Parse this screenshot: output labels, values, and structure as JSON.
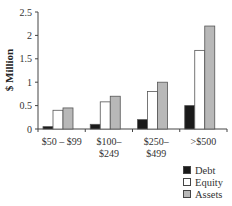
{
  "chart_data": {
    "type": "bar",
    "title": "",
    "xlabel": "",
    "ylabel": "$ Million",
    "ylim": [
      0,
      2.5
    ],
    "yticks": [
      "0",
      "0.5",
      "1",
      "1.5",
      "2",
      "2.5"
    ],
    "grid": false,
    "legend_position": "bottom-right",
    "categories": [
      "$50 – $99",
      "$100–\n$249",
      "$250–\n$499",
      ">$500"
    ],
    "category_lines": [
      [
        "$50 – $99"
      ],
      [
        "$100–",
        "$249"
      ],
      [
        "$250–",
        "$499"
      ],
      [
        ">$500"
      ]
    ],
    "series": [
      {
        "name": "Debt",
        "color": "#1a1a1a",
        "values": [
          0.05,
          0.1,
          0.2,
          0.5
        ]
      },
      {
        "name": "Equity",
        "color": "#ffffff",
        "values": [
          0.4,
          0.58,
          0.8,
          1.68
        ]
      },
      {
        "name": "Assets",
        "color": "#b8b8b8",
        "values": [
          0.45,
          0.7,
          1.0,
          2.2
        ]
      }
    ]
  },
  "legend": {
    "items": [
      {
        "label": "Debt",
        "color": "#1a1a1a"
      },
      {
        "label": "Equity",
        "color": "#ffffff"
      },
      {
        "label": "Assets",
        "color": "#b8b8b8"
      }
    ]
  }
}
